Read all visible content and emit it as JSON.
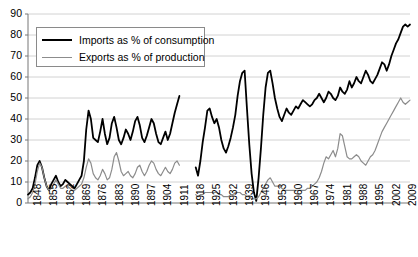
{
  "chart_data": {
    "type": "line",
    "title": "",
    "clipped_top_text": "",
    "xlabel": "",
    "ylabel": "",
    "ylim": [
      0,
      90
    ],
    "ytick_values": [
      0,
      10,
      20,
      30,
      40,
      50,
      60,
      70,
      80,
      90
    ],
    "xlim": [
      1848,
      2012
    ],
    "xtick_labels": [
      "1848",
      "1855",
      "1862",
      "1869",
      "1876",
      "1883",
      "1890",
      "1897",
      "1904",
      "1911",
      "1918",
      "1925",
      "1932",
      "1939",
      "1946",
      "1953",
      "1960",
      "1967",
      "1974",
      "1981",
      "1988",
      "1995",
      "2002",
      "2009"
    ],
    "grid": "horizontal",
    "legend_position": "top-left-inside",
    "legend": [
      {
        "name": "Imports as % of consumption",
        "color": "#000000",
        "width": 1.8
      },
      {
        "name": "Exports as % of production",
        "color": "#8c8c8c",
        "width": 1.2
      }
    ],
    "series": [
      {
        "name": "Imports as % of consumption",
        "color": "#000000",
        "gaps": [
          [
            1914,
            1919
          ]
        ],
        "points": [
          [
            1848,
            4
          ],
          [
            1849,
            5
          ],
          [
            1850,
            7
          ],
          [
            1851,
            12
          ],
          [
            1852,
            18
          ],
          [
            1853,
            20
          ],
          [
            1854,
            17
          ],
          [
            1855,
            12
          ],
          [
            1856,
            8
          ],
          [
            1857,
            6
          ],
          [
            1858,
            9
          ],
          [
            1859,
            11
          ],
          [
            1860,
            13
          ],
          [
            1861,
            10
          ],
          [
            1862,
            8
          ],
          [
            1863,
            9
          ],
          [
            1864,
            11
          ],
          [
            1865,
            10
          ],
          [
            1866,
            9
          ],
          [
            1867,
            8
          ],
          [
            1868,
            7
          ],
          [
            1869,
            9
          ],
          [
            1870,
            11
          ],
          [
            1871,
            13
          ],
          [
            1872,
            20
          ],
          [
            1873,
            35
          ],
          [
            1874,
            44
          ],
          [
            1875,
            40
          ],
          [
            1876,
            31
          ],
          [
            1877,
            30
          ],
          [
            1878,
            29
          ],
          [
            1879,
            34
          ],
          [
            1880,
            40
          ],
          [
            1881,
            33
          ],
          [
            1882,
            28
          ],
          [
            1883,
            31
          ],
          [
            1884,
            38
          ],
          [
            1885,
            41
          ],
          [
            1886,
            36
          ],
          [
            1887,
            30
          ],
          [
            1888,
            28
          ],
          [
            1889,
            31
          ],
          [
            1890,
            35
          ],
          [
            1891,
            33
          ],
          [
            1892,
            30
          ],
          [
            1893,
            34
          ],
          [
            1894,
            39
          ],
          [
            1895,
            41
          ],
          [
            1896,
            37
          ],
          [
            1897,
            31
          ],
          [
            1898,
            29
          ],
          [
            1899,
            32
          ],
          [
            1900,
            36
          ],
          [
            1901,
            40
          ],
          [
            1902,
            38
          ],
          [
            1903,
            33
          ],
          [
            1904,
            29
          ],
          [
            1905,
            28
          ],
          [
            1906,
            31
          ],
          [
            1907,
            34
          ],
          [
            1908,
            30
          ],
          [
            1909,
            33
          ],
          [
            1910,
            38
          ],
          [
            1911,
            43
          ],
          [
            1912,
            47
          ],
          [
            1913,
            51
          ],
          [
            1920,
            17
          ],
          [
            1921,
            13
          ],
          [
            1922,
            20
          ],
          [
            1923,
            29
          ],
          [
            1924,
            36
          ],
          [
            1925,
            44
          ],
          [
            1926,
            45
          ],
          [
            1927,
            41
          ],
          [
            1928,
            38
          ],
          [
            1929,
            40
          ],
          [
            1930,
            36
          ],
          [
            1931,
            30
          ],
          [
            1932,
            26
          ],
          [
            1933,
            24
          ],
          [
            1934,
            27
          ],
          [
            1935,
            31
          ],
          [
            1936,
            36
          ],
          [
            1937,
            42
          ],
          [
            1938,
            51
          ],
          [
            1939,
            58
          ],
          [
            1940,
            62
          ],
          [
            1941,
            63
          ],
          [
            1942,
            45
          ],
          [
            1943,
            28
          ],
          [
            1944,
            14
          ],
          [
            1945,
            5
          ],
          [
            1946,
            1
          ],
          [
            1947,
            12
          ],
          [
            1948,
            26
          ],
          [
            1949,
            42
          ],
          [
            1950,
            55
          ],
          [
            1951,
            62
          ],
          [
            1952,
            63
          ],
          [
            1953,
            57
          ],
          [
            1954,
            50
          ],
          [
            1955,
            45
          ],
          [
            1956,
            41
          ],
          [
            1957,
            39
          ],
          [
            1958,
            42
          ],
          [
            1959,
            45
          ],
          [
            1960,
            43
          ],
          [
            1961,
            42
          ],
          [
            1962,
            44
          ],
          [
            1963,
            46
          ],
          [
            1964,
            45
          ],
          [
            1965,
            47
          ],
          [
            1966,
            49
          ],
          [
            1967,
            48
          ],
          [
            1968,
            47
          ],
          [
            1969,
            46
          ],
          [
            1970,
            47
          ],
          [
            1971,
            49
          ],
          [
            1972,
            50
          ],
          [
            1973,
            52
          ],
          [
            1974,
            50
          ],
          [
            1975,
            48
          ],
          [
            1976,
            50
          ],
          [
            1977,
            53
          ],
          [
            1978,
            52
          ],
          [
            1979,
            50
          ],
          [
            1980,
            49
          ],
          [
            1981,
            51
          ],
          [
            1982,
            55
          ],
          [
            1983,
            53
          ],
          [
            1984,
            52
          ],
          [
            1985,
            54
          ],
          [
            1986,
            58
          ],
          [
            1987,
            55
          ],
          [
            1988,
            57
          ],
          [
            1989,
            60
          ],
          [
            1990,
            58
          ],
          [
            1991,
            57
          ],
          [
            1992,
            60
          ],
          [
            1993,
            63
          ],
          [
            1994,
            61
          ],
          [
            1995,
            58
          ],
          [
            1996,
            57
          ],
          [
            1997,
            59
          ],
          [
            1998,
            61
          ],
          [
            1999,
            64
          ],
          [
            2000,
            67
          ],
          [
            2001,
            66
          ],
          [
            2002,
            63
          ],
          [
            2003,
            66
          ],
          [
            2004,
            70
          ],
          [
            2005,
            73
          ],
          [
            2006,
            76
          ],
          [
            2007,
            78
          ],
          [
            2008,
            81
          ],
          [
            2009,
            84
          ],
          [
            2010,
            85
          ],
          [
            2011,
            84
          ],
          [
            2012,
            85
          ]
        ]
      },
      {
        "name": "Exports as % of production",
        "color": "#8c8c8c",
        "gaps": [
          [
            1914,
            1919
          ]
        ],
        "points": [
          [
            1848,
            2
          ],
          [
            1849,
            3
          ],
          [
            1850,
            5
          ],
          [
            1851,
            9
          ],
          [
            1852,
            15
          ],
          [
            1853,
            19
          ],
          [
            1854,
            17
          ],
          [
            1855,
            12
          ],
          [
            1856,
            8
          ],
          [
            1857,
            6
          ],
          [
            1858,
            7
          ],
          [
            1859,
            9
          ],
          [
            1860,
            11
          ],
          [
            1861,
            9
          ],
          [
            1862,
            7
          ],
          [
            1863,
            7
          ],
          [
            1864,
            8
          ],
          [
            1865,
            8
          ],
          [
            1866,
            7
          ],
          [
            1867,
            6
          ],
          [
            1868,
            6
          ],
          [
            1869,
            7
          ],
          [
            1870,
            8
          ],
          [
            1871,
            9
          ],
          [
            1872,
            12
          ],
          [
            1873,
            17
          ],
          [
            1874,
            21
          ],
          [
            1875,
            19
          ],
          [
            1876,
            14
          ],
          [
            1877,
            12
          ],
          [
            1878,
            11
          ],
          [
            1879,
            13
          ],
          [
            1880,
            16
          ],
          [
            1881,
            14
          ],
          [
            1882,
            11
          ],
          [
            1883,
            12
          ],
          [
            1884,
            16
          ],
          [
            1885,
            22
          ],
          [
            1886,
            24
          ],
          [
            1887,
            20
          ],
          [
            1888,
            15
          ],
          [
            1889,
            13
          ],
          [
            1890,
            14
          ],
          [
            1891,
            15
          ],
          [
            1892,
            13
          ],
          [
            1893,
            12
          ],
          [
            1894,
            14
          ],
          [
            1895,
            17
          ],
          [
            1896,
            18
          ],
          [
            1897,
            15
          ],
          [
            1898,
            13
          ],
          [
            1899,
            15
          ],
          [
            1900,
            18
          ],
          [
            1901,
            20
          ],
          [
            1902,
            19
          ],
          [
            1903,
            16
          ],
          [
            1904,
            14
          ],
          [
            1905,
            13
          ],
          [
            1906,
            15
          ],
          [
            1907,
            17
          ],
          [
            1908,
            15
          ],
          [
            1909,
            14
          ],
          [
            1910,
            16
          ],
          [
            1911,
            19
          ],
          [
            1912,
            20
          ],
          [
            1913,
            18
          ],
          [
            1920,
            4
          ],
          [
            1921,
            3
          ],
          [
            1922,
            4
          ],
          [
            1923,
            4
          ],
          [
            1924,
            5
          ],
          [
            1925,
            5
          ],
          [
            1926,
            5
          ],
          [
            1927,
            5
          ],
          [
            1928,
            5
          ],
          [
            1929,
            5
          ],
          [
            1930,
            4
          ],
          [
            1931,
            4
          ],
          [
            1932,
            3
          ],
          [
            1933,
            3
          ],
          [
            1934,
            3
          ],
          [
            1935,
            4
          ],
          [
            1936,
            4
          ],
          [
            1937,
            5
          ],
          [
            1938,
            5
          ],
          [
            1939,
            5
          ],
          [
            1940,
            4
          ],
          [
            1941,
            4
          ],
          [
            1942,
            3
          ],
          [
            1943,
            3
          ],
          [
            1944,
            2
          ],
          [
            1945,
            2
          ],
          [
            1946,
            2
          ],
          [
            1947,
            3
          ],
          [
            1948,
            5
          ],
          [
            1949,
            7
          ],
          [
            1950,
            9
          ],
          [
            1951,
            11
          ],
          [
            1952,
            12
          ],
          [
            1953,
            10
          ],
          [
            1954,
            8
          ],
          [
            1955,
            8
          ],
          [
            1956,
            8
          ],
          [
            1957,
            7
          ],
          [
            1958,
            6
          ],
          [
            1959,
            6
          ],
          [
            1960,
            6
          ],
          [
            1961,
            6
          ],
          [
            1962,
            6
          ],
          [
            1963,
            6
          ],
          [
            1964,
            6
          ],
          [
            1965,
            6
          ],
          [
            1966,
            6
          ],
          [
            1967,
            6
          ],
          [
            1968,
            7
          ],
          [
            1969,
            7
          ],
          [
            1970,
            8
          ],
          [
            1971,
            9
          ],
          [
            1972,
            10
          ],
          [
            1973,
            12
          ],
          [
            1974,
            15
          ],
          [
            1975,
            19
          ],
          [
            1976,
            22
          ],
          [
            1977,
            21
          ],
          [
            1978,
            23
          ],
          [
            1979,
            25
          ],
          [
            1980,
            22
          ],
          [
            1981,
            26
          ],
          [
            1982,
            33
          ],
          [
            1983,
            32
          ],
          [
            1984,
            27
          ],
          [
            1985,
            22
          ],
          [
            1986,
            21
          ],
          [
            1987,
            21
          ],
          [
            1988,
            22
          ],
          [
            1989,
            23
          ],
          [
            1990,
            22
          ],
          [
            1991,
            20
          ],
          [
            1992,
            19
          ],
          [
            1993,
            18
          ],
          [
            1994,
            20
          ],
          [
            1995,
            22
          ],
          [
            1996,
            23
          ],
          [
            1997,
            25
          ],
          [
            1998,
            28
          ],
          [
            1999,
            31
          ],
          [
            2000,
            34
          ],
          [
            2001,
            36
          ],
          [
            2002,
            38
          ],
          [
            2003,
            40
          ],
          [
            2004,
            42
          ],
          [
            2005,
            44
          ],
          [
            2006,
            46
          ],
          [
            2007,
            48
          ],
          [
            2008,
            50
          ],
          [
            2009,
            48
          ],
          [
            2010,
            47
          ],
          [
            2011,
            48
          ],
          [
            2012,
            49
          ]
        ]
      }
    ]
  }
}
